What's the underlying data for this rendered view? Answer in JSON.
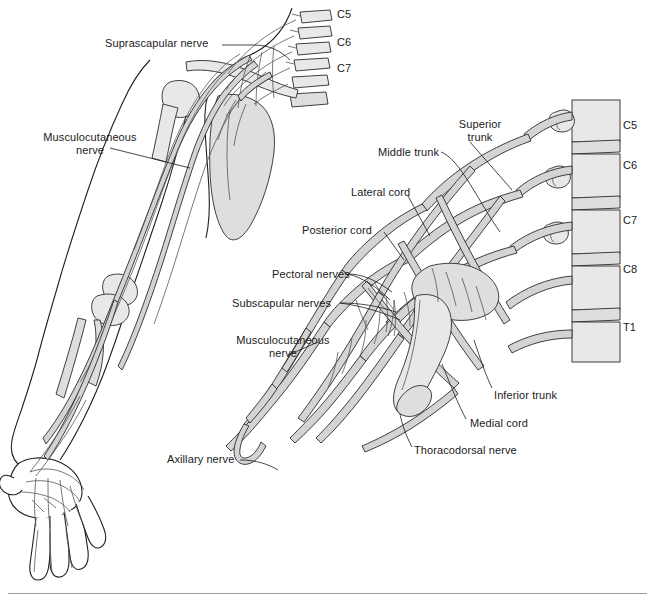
{
  "figure": {
    "panels": [
      {
        "name": "upper-limb-overview",
        "description": "Anterior view of the right upper limb showing the course of peripheral nerves from the cervical spine to the hand"
      },
      {
        "name": "brachial-plexus-detail",
        "description": "Enlarged view of the brachial plexus showing roots, trunks, divisions, cords and terminal branches"
      }
    ]
  },
  "left_panel": {
    "labels": [
      {
        "id": "suprascapular-nerve",
        "text": "Suprascapular nerve",
        "x": 105,
        "y": 43,
        "align": "left"
      },
      {
        "id": "musculocutaneous-nerve",
        "text": "Musculocutaneous\nnerve",
        "x": 30,
        "y": 133,
        "align": "left"
      }
    ],
    "spinal_levels": [
      {
        "id": "c5",
        "text": "C5",
        "x": 337,
        "y": 8
      },
      {
        "id": "c6",
        "text": "C6",
        "x": 337,
        "y": 36
      },
      {
        "id": "c7",
        "text": "C7",
        "x": 337,
        "y": 62
      }
    ]
  },
  "right_panel": {
    "labels": [
      {
        "id": "superior-trunk",
        "text": "Superior\ntrunk",
        "x": 452,
        "y": 118,
        "align": "center"
      },
      {
        "id": "middle-trunk",
        "text": "Middle trunk",
        "x": 378,
        "y": 148,
        "align": "left"
      },
      {
        "id": "lateral-cord",
        "text": "Lateral cord",
        "x": 351,
        "y": 188,
        "align": "left"
      },
      {
        "id": "posterior-cord",
        "text": "Posterior cord",
        "x": 302,
        "y": 226,
        "align": "left"
      },
      {
        "id": "pectoral-nerves",
        "text": "Pectoral nerves",
        "x": 272,
        "y": 270,
        "align": "left"
      },
      {
        "id": "subscapular-nerves",
        "text": "Subscapular nerves",
        "x": 232,
        "y": 299,
        "align": "left"
      },
      {
        "id": "musculocutaneous-nerve-2",
        "text": "Musculocutaneous\nnerve",
        "x": 222,
        "y": 336,
        "align": "left"
      },
      {
        "id": "axillary-nerve",
        "text": "Axillary nerve",
        "x": 167,
        "y": 455,
        "align": "left"
      },
      {
        "id": "inferior-trunk",
        "text": "Inferior trunk",
        "x": 494,
        "y": 391,
        "align": "left"
      },
      {
        "id": "medial-cord",
        "text": "Medial cord",
        "x": 470,
        "y": 419,
        "align": "left"
      },
      {
        "id": "thoracodorsal-nerve",
        "text": "Thoracodorsal nerve",
        "x": 414,
        "y": 446,
        "align": "left"
      }
    ],
    "spinal_levels": [
      {
        "id": "c5",
        "text": "C5",
        "x": 623,
        "y": 119
      },
      {
        "id": "c6",
        "text": "C6",
        "x": 623,
        "y": 159
      },
      {
        "id": "c7",
        "text": "C7",
        "x": 623,
        "y": 214
      },
      {
        "id": "c8",
        "text": "C8",
        "x": 623,
        "y": 263
      },
      {
        "id": "t1",
        "text": "T1",
        "x": 623,
        "y": 321
      }
    ]
  },
  "colors": {
    "nerve_fill": "#d4d4d4",
    "nerve_stroke": "#2b2b2b",
    "bone_fill": "#e8e8e8",
    "outline": "#1f1f1f",
    "text": "#1a1a1a",
    "divider": "#9a9a9a",
    "background": "#ffffff"
  }
}
